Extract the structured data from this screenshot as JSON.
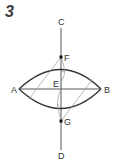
{
  "figure": {
    "step_number": "3",
    "points": {
      "A": {
        "label": "A",
        "x": 19,
        "y": 89
      },
      "B": {
        "label": "B",
        "x": 101,
        "y": 89
      },
      "C": {
        "label": "C",
        "x": 61,
        "y": 22
      },
      "D": {
        "label": "D",
        "x": 61,
        "y": 155
      },
      "E": {
        "label": "E",
        "x": 61,
        "y": 89
      },
      "F": {
        "label": "F",
        "x": 61,
        "y": 57
      },
      "G": {
        "label": "G",
        "x": 61,
        "y": 121
      }
    },
    "colors": {
      "main_line": "#333333",
      "construction_line": "#9a9a9a",
      "label": "#333333"
    }
  }
}
